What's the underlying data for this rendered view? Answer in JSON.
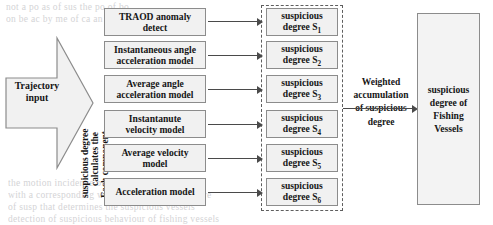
{
  "figure": {
    "input": {
      "label_line1": "Trajectory",
      "label_line2": "input",
      "shape": "right-arrow-pentagon"
    },
    "rotated_caption": {
      "line1": "Each component",
      "line2": "calculates the",
      "line3": "suspicious degree"
    },
    "models": [
      {
        "line1": "TRAOD anomaly",
        "line2": "detect"
      },
      {
        "line1": "Instantaneous angle",
        "line2": "acceleration model"
      },
      {
        "line1": "Average angle",
        "line2": "acceleration model"
      },
      {
        "line1": "Instantanute",
        "line2": "velocity model"
      },
      {
        "line1": "Average velocity",
        "line2": "model"
      },
      {
        "line1": "Acceleration model",
        "line2": ""
      }
    ],
    "degrees": [
      {
        "line1": "suspicious",
        "line2_prefix": "degree S",
        "subscript": "1"
      },
      {
        "line1": "suspicious",
        "line2_prefix": "degree S",
        "subscript": "2"
      },
      {
        "line1": "suspicious",
        "line2_prefix": "degree S",
        "subscript": "3"
      },
      {
        "line1": "suspicious",
        "line2_prefix": "degree S",
        "subscript": "4"
      },
      {
        "line1": "suspicious",
        "line2_prefix": "degree S",
        "subscript": "5"
      },
      {
        "line1": "suspicious",
        "line2_prefix": "degree S",
        "subscript": "6"
      }
    ],
    "weighted": {
      "line1": "Weighted",
      "line2": "accumulation",
      "line3": "of suspicious",
      "line4": "degree"
    },
    "output": {
      "line1": "suspicious",
      "line2": "degree of",
      "line3": "Fishing",
      "line4": "Vessels"
    },
    "colors": {
      "box_fill": "#f1f1f1",
      "box_border": "#8c8c8c",
      "dashed_border": "#5e5e5e",
      "arrow": "#4a4a4a",
      "text": "#161616",
      "background": "#ffffff"
    }
  },
  "bleed_text": {
    "top_1": "not a   po    as  of   sus    the  po   of   bo",
    "top_2": "on  be  ac  by   me  of   ca   an   the  all  of  the",
    "bottom_1": "the  motion  incidence  of  the  su   ve   be  considered",
    "bottom_2": "with  a  corresponding  weight  to  obtain  the  compre",
    "bottom_3": "of  susp  that  determines  the  suspicious  vessels",
    "bottom_4": "detection  of  suspicious  behaviour  of  fishing  vessels"
  }
}
